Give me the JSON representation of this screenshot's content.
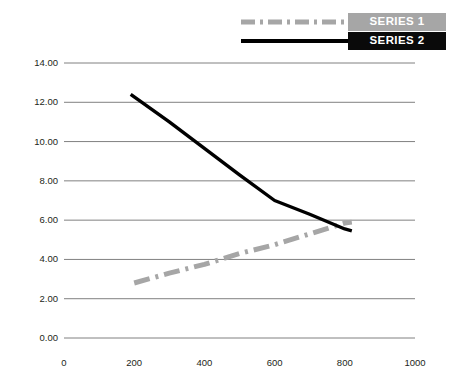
{
  "chart_data": {
    "type": "line",
    "title": "",
    "xlabel": "",
    "ylabel": "",
    "xlim": [
      0,
      1000
    ],
    "ylim": [
      0,
      14
    ],
    "xticks": [
      0,
      200,
      400,
      600,
      800,
      1000
    ],
    "yticks": [
      0,
      2,
      4,
      6,
      8,
      10,
      12,
      14
    ],
    "xtick_labels": [
      "0",
      "200",
      "400",
      "600",
      "800",
      "1000"
    ],
    "ytick_labels": [
      "0.00",
      "2.00",
      "4.00",
      "6.00",
      "8.00",
      "10.00",
      "12.00",
      "14.00"
    ],
    "grid": "horizontal",
    "legend_position": "top-right",
    "series": [
      {
        "name": "SERIES 1",
        "color": "#a6a6a6",
        "style": "dash-dot",
        "x": [
          200,
          300,
          400,
          500,
          600,
          700,
          800,
          820
        ],
        "values": [
          2.8,
          3.3,
          3.75,
          4.3,
          4.75,
          5.3,
          5.85,
          5.9
        ]
      },
      {
        "name": "SERIES 2",
        "color": "#000000",
        "style": "solid",
        "x": [
          190,
          300,
          400,
          500,
          600,
          700,
          800,
          820
        ],
        "values": [
          12.4,
          11.0,
          9.65,
          8.3,
          7.0,
          6.3,
          5.55,
          5.45
        ]
      }
    ]
  },
  "legend": {
    "entries": [
      {
        "label": "SERIES 1",
        "box_color": "#a6a6a6",
        "line_color": "#a6a6a6",
        "style": "dash-dot"
      },
      {
        "label": "SERIES 2",
        "box_color": "#0a0a0a",
        "line_color": "#000000",
        "style": "solid"
      }
    ]
  },
  "axes": {
    "y_labels": [
      "14.00",
      "12.00",
      "10.00",
      "8.00",
      "6.00",
      "4.00",
      "2.00",
      "0.00"
    ],
    "x_labels": [
      "0",
      "200",
      "400",
      "600",
      "800",
      "1000"
    ]
  },
  "colors": {
    "grid": "#808080",
    "series1": "#a6a6a6",
    "series2": "#000000",
    "text": "#231f20",
    "background": "#ffffff"
  }
}
